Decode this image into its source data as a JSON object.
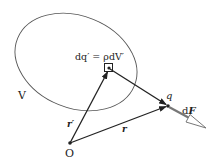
{
  "diagram": {
    "region_label": "V",
    "charge_element_label": "dq′ = ρdV′",
    "origin_label": "O",
    "point_charge_label": "q",
    "force_label_prefix": "d",
    "force_label_symbol": "F",
    "source_vector_label": "r′",
    "field_vector_label": "r",
    "colors": {
      "stroke": "#222222",
      "ellipse": "#555555",
      "force_arrow": "#777777"
    }
  }
}
